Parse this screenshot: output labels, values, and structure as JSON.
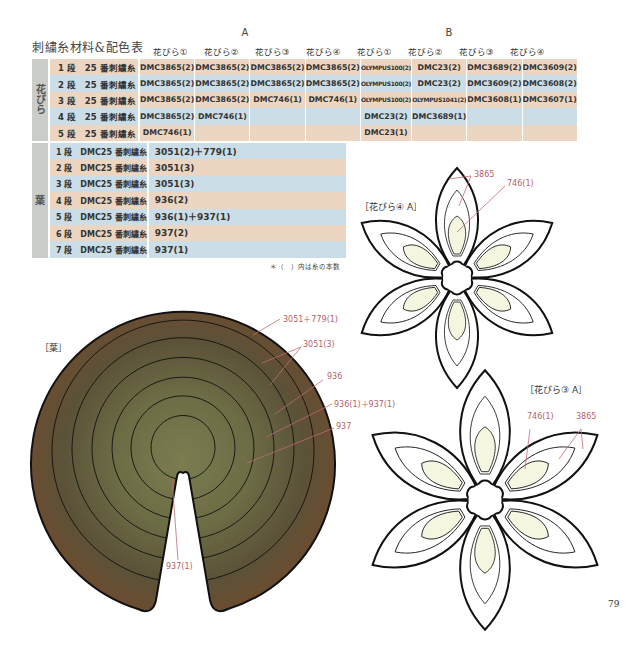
{
  "title": "刺繍糸材料&配色表",
  "groups": {
    "a": "A",
    "b": "B"
  },
  "column_headers": [
    "花びら①",
    "花びら②",
    "花びら③",
    "花びら④",
    "花びら①",
    "花びら②",
    "花びら③",
    "花びら④"
  ],
  "petals": {
    "section_label": "花びら",
    "rows": [
      {
        "label": "1 段　25 番刺繍糸",
        "bg": "pk",
        "values": [
          "DMC3865(2)",
          "DMC3865(2)",
          "DMC3865(2)",
          "DMC3865(2)",
          "OLYMPUS100(2)",
          "DMC23(2)",
          "DMC3689(2)",
          "DMC3609(2)"
        ]
      },
      {
        "label": "2 段　25 番刺繍糸",
        "bg": "bl",
        "values": [
          "DMC3865(2)",
          "DMC3865(2)",
          "DMC3865(2)",
          "DMC3865(2)",
          "OLYMPUS100(2)",
          "DMC23(2)",
          "DMC3609(2)",
          "DMC3608(2)"
        ]
      },
      {
        "label": "3 段　25 番刺繍糸",
        "bg": "pk",
        "values": [
          "DMC3865(2)",
          "DMC3865(2)",
          "DMC746(1)",
          "DMC746(1)",
          "OLYMPUS100(2)",
          "OLYMPUS1041(2)",
          "DMC3608(1)",
          "DMC3607(1)"
        ]
      },
      {
        "label": "4 段　25 番刺繍糸",
        "bg": "bl",
        "values": [
          "DMC3865(2)",
          "DMC746(1)",
          "",
          "",
          "DMC23(2)",
          "DMC3689(1)",
          "",
          ""
        ]
      },
      {
        "label": "5 段　25 番刺繍糸",
        "bg": "pk",
        "values": [
          "DMC746(1)",
          "",
          "",
          "",
          "DMC23(1)",
          "",
          "",
          ""
        ]
      }
    ]
  },
  "leaf": {
    "section_label": "葉",
    "rows": [
      {
        "label": "1 段　DMC25 番刺繍糸",
        "bg": "bl",
        "value": "3051(2)＋779(1)"
      },
      {
        "label": "2 段　DMC25 番刺繍糸",
        "bg": "pk",
        "value": "3051(3)"
      },
      {
        "label": "3 段　DMC25 番刺繍糸",
        "bg": "bl",
        "value": "3051(3)"
      },
      {
        "label": "4 段　DMC25 番刺繍糸",
        "bg": "pk",
        "value": "936(2)"
      },
      {
        "label": "5 段　DMC25 番刺繍糸",
        "bg": "bl",
        "value": "936(1)＋937(1)"
      },
      {
        "label": "6 段　DMC25 番刺繍糸",
        "bg": "pk",
        "value": "937(2)"
      },
      {
        "label": "7 段　DMC25 番刺繍糸",
        "bg": "bl",
        "value": "937(1)"
      }
    ]
  },
  "note": "＊（　）内は糸の本数",
  "diagrams": {
    "leaf": {
      "label": "［葉］",
      "annotations": [
        "3051＋779(1)",
        "3051(3)",
        "936",
        "936(1)＋937(1)",
        "937",
        "937(1)"
      ]
    },
    "petal4a": {
      "label": "［花びら④ A］",
      "annotations": [
        "3865",
        "746(1)"
      ]
    },
    "petal3a": {
      "label": "［花びら③ A］",
      "annotations": [
        "746(1)",
        "3865"
      ]
    }
  },
  "colors": {
    "row_pink": "#ecd6c1",
    "row_blue": "#cbdde6",
    "side_gray": "#c9ccc7",
    "annotation": "#b5616a",
    "leaf_outer": "#5f4a32",
    "leaf_inner": "#77794e",
    "petal_fill_light": "#f5f6df"
  },
  "page_number": "79"
}
